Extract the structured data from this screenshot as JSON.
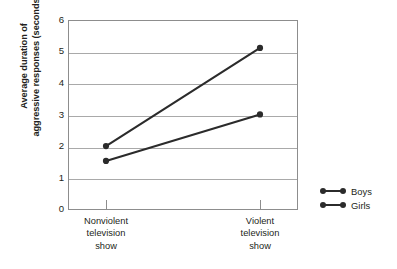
{
  "chart_data": {
    "type": "line",
    "title": "",
    "subtitle": "",
    "xlabel": "",
    "ylabel": "Average duration of aggressive responses (seconds)",
    "ylabel_lines": [
      "Average duration of",
      "aggressive responses (seconds)"
    ],
    "categories": [
      "Nonviolent television show",
      "Violent television show"
    ],
    "category_label_lines": [
      [
        "Nonviolent",
        "television",
        "show"
      ],
      [
        "Violent",
        "television",
        "show"
      ]
    ],
    "series": [
      {
        "name": "Boys",
        "values": [
          2.05,
          5.15
        ],
        "color": "#2b2b2b",
        "marker": "circle"
      },
      {
        "name": "Girls",
        "values": [
          1.58,
          3.05
        ],
        "color": "#2b2b2b",
        "marker": "circle"
      }
    ],
    "ylim": [
      0,
      6
    ],
    "xlim": [
      0,
      1
    ],
    "y_ticks": [
      0,
      1,
      2,
      3,
      4,
      5,
      6
    ],
    "y_tick_labels": [
      "0",
      "1",
      "2",
      "3",
      "4",
      "5",
      "6"
    ],
    "grid": true,
    "grid_axis": "y",
    "grid_color": "#a9a9a9",
    "frame_color": "#8d8d8d",
    "legend_position": "right",
    "legend_entries": [
      "Boys",
      "Girls"
    ],
    "background": "#ffffff"
  },
  "legend": {
    "rows": [
      {
        "label": "Boys"
      },
      {
        "label": "Girls"
      }
    ]
  },
  "axes": {
    "y_title_line1": "Average duration of",
    "y_title_line2": "aggressive responses (seconds)",
    "y_labels": [
      "6",
      "5",
      "4",
      "3",
      "2",
      "1",
      "0"
    ],
    "x_labels": [
      {
        "l1": "Nonviolent",
        "l2": "television",
        "l3": "show"
      },
      {
        "l1": "Violent",
        "l2": "television",
        "l3": "show"
      }
    ]
  }
}
